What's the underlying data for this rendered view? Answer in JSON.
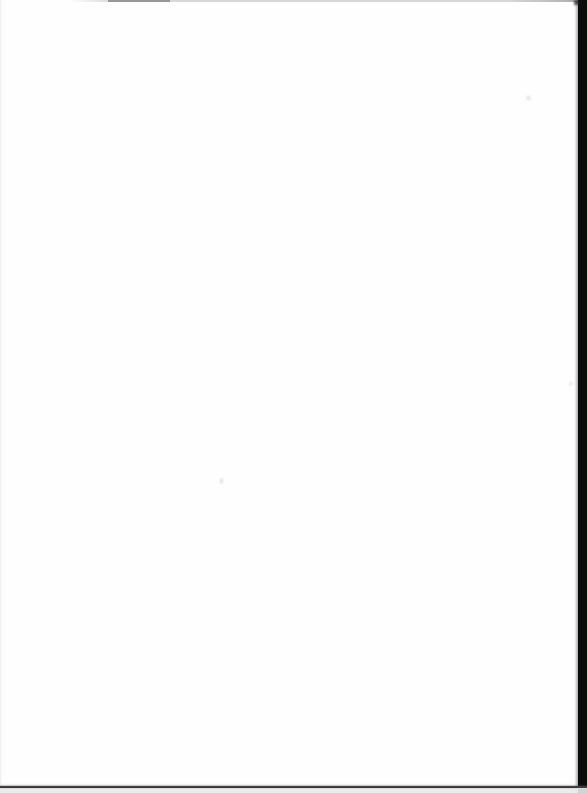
{
  "scan": {
    "paper_color": "#fefefe",
    "left_line_color": "#e9e9e9",
    "top_line_color": "#b8b8b8",
    "top_smudge_color": "#8d8d8d",
    "right_bar_color": "#0c0c0c",
    "right_wedge_color": "#1a1a1a",
    "bottom_line_color": "#3d3d3d",
    "bottom_margin_color": "#e9e9e9",
    "speck_color": "#dcdcda"
  }
}
